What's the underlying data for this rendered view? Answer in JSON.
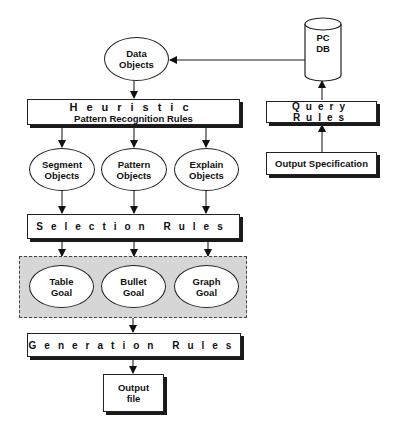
{
  "diagram": {
    "nodes": {
      "data_objects": {
        "line1": "Data",
        "line2": "Objects"
      },
      "pc_db": {
        "line1": "PC",
        "line2": "DB"
      },
      "heuristic": {
        "title": "Heuristic",
        "subtitle": "Pattern Recognition Rules"
      },
      "query_rules": {
        "label": "Query Rules"
      },
      "output_spec": {
        "label": "Output Specification"
      },
      "segment_objects": {
        "line1": "Segment",
        "line2": "Objects"
      },
      "pattern_objects": {
        "line1": "Pattern",
        "line2": "Objects"
      },
      "explain_objects": {
        "line1": "Explain",
        "line2": "Objects"
      },
      "selection_rules": {
        "label": "Selection Rules"
      },
      "table_goal": {
        "line1": "Table",
        "line2": "Goal"
      },
      "bullet_goal": {
        "line1": "Bullet",
        "line2": "Goal"
      },
      "graph_goal": {
        "line1": "Graph",
        "line2": "Goal"
      },
      "generation_rules": {
        "label": "Generation Rules"
      },
      "output_file": {
        "line1": "Output",
        "line2": "file"
      }
    },
    "edges": [
      {
        "from": "pc_db",
        "to": "data_objects"
      },
      {
        "from": "data_objects",
        "to": "heuristic"
      },
      {
        "from": "heuristic",
        "to": "segment_objects"
      },
      {
        "from": "heuristic",
        "to": "pattern_objects"
      },
      {
        "from": "heuristic",
        "to": "explain_objects"
      },
      {
        "from": "segment_objects",
        "to": "selection_rules"
      },
      {
        "from": "pattern_objects",
        "to": "selection_rules"
      },
      {
        "from": "explain_objects",
        "to": "selection_rules"
      },
      {
        "from": "selection_rules",
        "to": "table_goal"
      },
      {
        "from": "selection_rules",
        "to": "bullet_goal"
      },
      {
        "from": "selection_rules",
        "to": "graph_goal"
      },
      {
        "from": "goal_group",
        "to": "generation_rules"
      },
      {
        "from": "generation_rules",
        "to": "output_file"
      },
      {
        "from": "output_spec",
        "to": "query_rules"
      },
      {
        "from": "query_rules",
        "to": "pc_db"
      }
    ],
    "colors": {
      "line": "#222222",
      "group_fill": "#d6d6d6",
      "shadow": "#1a1a1a"
    }
  }
}
